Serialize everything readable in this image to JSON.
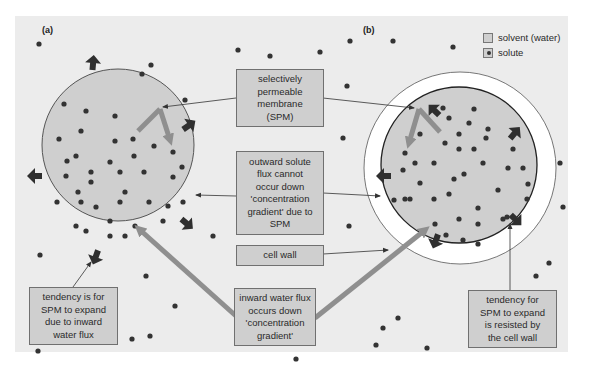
{
  "figure": {
    "panel_labels": [
      "(a)",
      "(b)"
    ],
    "colors": {
      "background_panel": "#ececec",
      "solvent": "#cfcfcf",
      "cell_wall": "#ffffff",
      "solute_dot": "#333333",
      "gray_arrow": "#8f8f8f",
      "dark_arrow": "#2f2f2f",
      "box_fill": "#cfcfcf",
      "box_border": "#707070"
    }
  },
  "legend": {
    "items": [
      {
        "label": "solvent (water)",
        "symbol": "gray-square"
      },
      {
        "label": "solute",
        "symbol": "dot-in-square"
      }
    ]
  },
  "callouts": {
    "spm": "selectively\npermeable\nmembrane\n(SPM)",
    "outward_flux": "outward solute\nflux cannot\noccur down\n'concentration\ngradient' due to\nSPM",
    "cell_wall": "cell wall",
    "inward_flux": "inward water flux\noccurs down\n'concentration\ngradient'",
    "tendency_left": "tendency is for\nSPM to expand\ndue to inward\nwater flux",
    "tendency_right": "tendency for\nSPM to expand\nis resisted by\nthe cell wall"
  }
}
